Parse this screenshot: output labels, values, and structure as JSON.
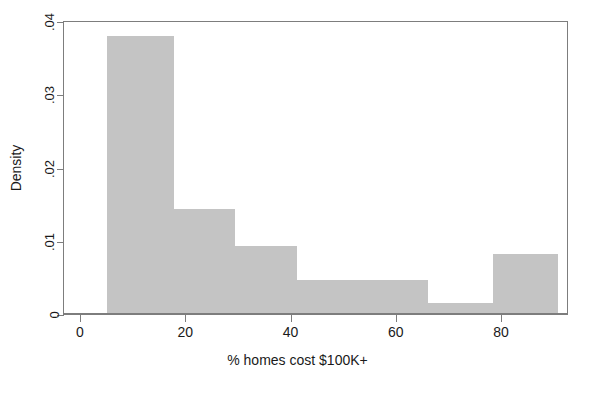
{
  "chart_data": {
    "type": "bar",
    "subtype": "histogram",
    "title": "",
    "xlabel": "% homes cost $100K+",
    "ylabel": "Density",
    "xlim": [
      0,
      92.7
    ],
    "ylim": [
      0,
      0.04
    ],
    "grid": false,
    "legend": null,
    "bar_color": "#c4c4c4",
    "axis_color": "#7d7d7d",
    "xticks": [
      {
        "value": 0,
        "label": "0"
      },
      {
        "value": 20,
        "label": "20"
      },
      {
        "value": 40,
        "label": "40"
      },
      {
        "value": 60,
        "label": "60"
      },
      {
        "value": 80,
        "label": "80"
      }
    ],
    "yticks": [
      {
        "value": 0,
        "label": "0"
      },
      {
        "value": 0.01,
        "label": ".01"
      },
      {
        "value": 0.02,
        "label": ".02"
      },
      {
        "value": 0.03,
        "label": ".03"
      },
      {
        "value": 0.04,
        "label": ".04"
      }
    ],
    "bins": [
      {
        "x0": 4.9,
        "x1": 17.7,
        "density": 0.0378
      },
      {
        "x0": 17.7,
        "x1": 29.3,
        "density": 0.0142
      },
      {
        "x0": 29.3,
        "x1": 41.0,
        "density": 0.0092
      },
      {
        "x0": 41.0,
        "x1": 53.6,
        "density": 0.0045
      },
      {
        "x0": 53.6,
        "x1": 65.9,
        "density": 0.0045
      },
      {
        "x0": 65.9,
        "x1": 78.3,
        "density": 0.0014
      },
      {
        "x0": 78.3,
        "x1": 90.6,
        "density": 0.008
      }
    ],
    "x": [
      4.9,
      17.7,
      29.3,
      41.0,
      53.6,
      65.9,
      78.3
    ],
    "values": [
      0.0378,
      0.0142,
      0.0092,
      0.0045,
      0.0045,
      0.0014,
      0.008
    ]
  }
}
